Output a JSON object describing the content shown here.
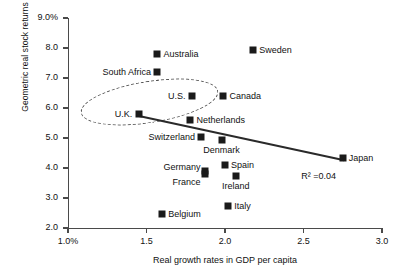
{
  "chart_data": {
    "type": "scatter",
    "title": "",
    "xlabel": "Real growth rates in GDP per capita",
    "ylabel": "Geometric real stock returns",
    "xlim": [
      1.0,
      3.0
    ],
    "ylim": [
      2.0,
      9.0
    ],
    "grid": false,
    "legend": "none",
    "xticks": [
      "1.0%",
      "1.5",
      "2.0",
      "2.5",
      "3.0"
    ],
    "xtick_values": [
      1.0,
      1.5,
      2.0,
      2.5,
      3.0
    ],
    "yticks": [
      "9.0%",
      "8.0",
      "7.0",
      "6.0",
      "5.0",
      "4.0",
      "3.0",
      "2.0"
    ],
    "ytick_values": [
      9.0,
      8.0,
      7.0,
      6.0,
      5.0,
      4.0,
      3.0,
      2.0
    ],
    "points": [
      {
        "label": "Australia",
        "x": 1.57,
        "y": 7.8,
        "label_pos": "right"
      },
      {
        "label": "Sweden",
        "x": 2.18,
        "y": 7.95,
        "label_pos": "right"
      },
      {
        "label": "South Africa",
        "x": 1.57,
        "y": 7.2,
        "label_pos": "left"
      },
      {
        "label": "U.S.",
        "x": 1.79,
        "y": 6.4,
        "label_pos": "left"
      },
      {
        "label": "Canada",
        "x": 1.99,
        "y": 6.4,
        "label_pos": "right"
      },
      {
        "label": "U.K.",
        "x": 1.45,
        "y": 5.8,
        "label_pos": "left"
      },
      {
        "label": "Netherlands",
        "x": 1.78,
        "y": 5.6,
        "label_pos": "right"
      },
      {
        "label": "Switzerland",
        "x": 1.85,
        "y": 5.05,
        "label_pos": "left"
      },
      {
        "label": "Denmark",
        "x": 1.98,
        "y": 4.95,
        "label_pos": "below"
      },
      {
        "label": "Germany",
        "x": 1.87,
        "y": 3.9,
        "label_pos": "above-left"
      },
      {
        "label": "France",
        "x": 1.87,
        "y": 3.8,
        "label_pos": "below-left"
      },
      {
        "label": "Spain",
        "x": 2.0,
        "y": 4.1,
        "label_pos": "right"
      },
      {
        "label": "Ireland",
        "x": 2.07,
        "y": 3.75,
        "label_pos": "below"
      },
      {
        "label": "Italy",
        "x": 2.02,
        "y": 2.75,
        "label_pos": "right"
      },
      {
        "label": "Belgium",
        "x": 1.6,
        "y": 2.48,
        "label_pos": "right"
      },
      {
        "label": "Japan",
        "x": 2.75,
        "y": 4.35,
        "label_pos": "right"
      }
    ],
    "trendline": {
      "x_start": 1.45,
      "y_start": 5.78,
      "x_end": 2.76,
      "y_end": 4.3,
      "annotation": "R² =0.04"
    },
    "annotations": [
      {
        "name": "highlight-ellipse",
        "description": "dashed ellipse grouping U.K., U.S. and nearby points"
      }
    ]
  }
}
